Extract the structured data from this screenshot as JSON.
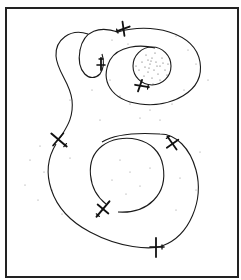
{
  "figure": {
    "caption_fragment": "··· ··· ··· ··· ··· ···",
    "colors": {
      "ink": "#1a1a1a",
      "frame": "#222222",
      "background": "#ffffff",
      "stipple": "#666666"
    },
    "paths": [
      {
        "name": "upper-outer-loop",
        "type": "spiral"
      },
      {
        "name": "upper-inner-circle",
        "type": "circle"
      },
      {
        "name": "upper-small-loop",
        "type": "loop"
      },
      {
        "name": "connecting-tail",
        "type": "curve"
      },
      {
        "name": "lower-outer-loop",
        "type": "ellipse"
      },
      {
        "name": "lower-inner-circle",
        "type": "circle"
      }
    ],
    "aircraft_count": 8,
    "aircraft": [
      {
        "id": "plane-top",
        "x": 122,
        "y": 30
      },
      {
        "id": "plane-small-loop",
        "x": 101,
        "y": 65
      },
      {
        "id": "plane-inner-circle",
        "x": 141,
        "y": 87
      },
      {
        "id": "plane-left",
        "x": 58,
        "y": 140
      },
      {
        "id": "plane-right",
        "x": 172,
        "y": 143
      },
      {
        "id": "plane-lower-inner",
        "x": 103,
        "y": 208
      },
      {
        "id": "plane-bottom",
        "x": 156,
        "y": 248
      }
    ]
  }
}
